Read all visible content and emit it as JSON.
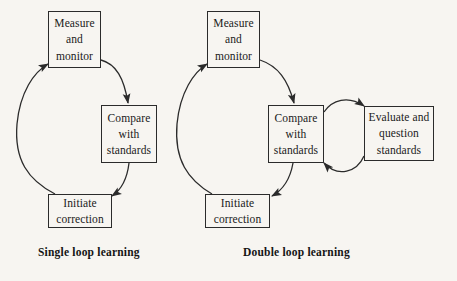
{
  "figure": {
    "background_color": "#f7f5f1",
    "line_color": "#2b2b2b",
    "text_color": "#1a1a1a"
  },
  "diagrams": [
    {
      "id": "single-loop",
      "caption": "Single loop learning",
      "nodes": [
        {
          "id": "measure",
          "lines": [
            "Measure",
            "and",
            "monitor"
          ]
        },
        {
          "id": "compare",
          "lines": [
            "Compare",
            "with",
            "standards"
          ]
        },
        {
          "id": "initiate",
          "lines": [
            "Initiate",
            "correction"
          ]
        }
      ],
      "edges": [
        {
          "from": "measure",
          "to": "compare",
          "arrow": "down-right"
        },
        {
          "from": "compare",
          "to": "initiate",
          "arrow": "down-left"
        },
        {
          "from": "initiate",
          "to": "measure",
          "arrow": "up"
        }
      ]
    },
    {
      "id": "double-loop",
      "caption": "Double loop learning",
      "nodes": [
        {
          "id": "measure",
          "lines": [
            "Measure",
            "and",
            "monitor"
          ]
        },
        {
          "id": "compare",
          "lines": [
            "Compare",
            "with",
            "standards"
          ]
        },
        {
          "id": "initiate",
          "lines": [
            "Initiate",
            "correction"
          ]
        },
        {
          "id": "evaluate",
          "lines": [
            "Evaluate and",
            "question",
            "standards"
          ]
        }
      ],
      "edges": [
        {
          "from": "measure",
          "to": "compare",
          "arrow": "down-right"
        },
        {
          "from": "compare",
          "to": "initiate",
          "arrow": "down-left"
        },
        {
          "from": "initiate",
          "to": "measure",
          "arrow": "up"
        },
        {
          "from": "compare",
          "to": "evaluate",
          "arrow": "right-top"
        },
        {
          "from": "evaluate",
          "to": "compare",
          "arrow": "left-bottom"
        }
      ]
    }
  ],
  "labels": {
    "measure_1": "Measure",
    "measure_2": "and",
    "measure_3": "monitor",
    "compare_1": "Compare",
    "compare_2": "with",
    "compare_3": "standards",
    "initiate_1": "Initiate",
    "initiate_2": "correction",
    "evaluate_1": "Evaluate and",
    "evaluate_2": "question",
    "evaluate_3": "standards",
    "caption_single": "Single loop learning",
    "caption_double": "Double loop learning"
  }
}
